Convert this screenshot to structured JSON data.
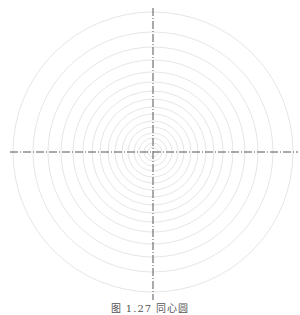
{
  "diagram": {
    "type": "concentric-circles",
    "center": {
      "x": 153,
      "y": 152
    },
    "radii": [
      5,
      9,
      14,
      19,
      25,
      31,
      38,
      45,
      53,
      61,
      70,
      80,
      92,
      105,
      120,
      140
    ],
    "ring_color": "#e6e6e6",
    "axis_color": "#555555",
    "axes": {
      "horizontal": {
        "x1": 10,
        "x2": 298,
        "y": 152
      },
      "vertical": {
        "x": 153,
        "y1": 8,
        "y2": 300
      }
    }
  },
  "caption": "图 1.27  同心圆"
}
